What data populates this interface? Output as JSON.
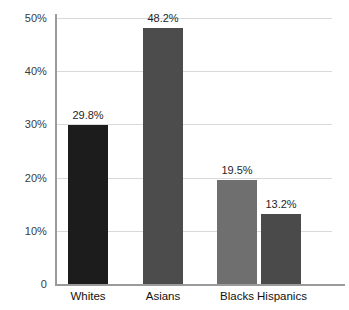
{
  "chart_data": {
    "type": "bar",
    "title": "",
    "subtitle": "",
    "xlabel": "",
    "ylabel": "",
    "categories": [
      "Whites",
      "Asians",
      "Blacks",
      "Hispanics"
    ],
    "values": [
      29.8,
      48.2,
      19.5,
      13.2
    ],
    "value_labels": [
      "29.8%",
      "48.2%",
      "19.5%",
      "13.2%"
    ],
    "bar_colors": [
      "#1c1c1c",
      "#4c4c4c",
      "#6f6f6f",
      "#4a4a4a"
    ],
    "ylim": [
      0,
      52
    ],
    "y_ticks": [
      0,
      10,
      20,
      30,
      40,
      50
    ],
    "y_tick_labels": [
      "0",
      "10%",
      "20%",
      "30%",
      "40%",
      "50%"
    ],
    "grid": true,
    "grid_color": "#d9d9d9",
    "axis_color": "#9a9a9a",
    "legend": "none",
    "legend_position": "none",
    "background_color": "#ffffff"
  }
}
